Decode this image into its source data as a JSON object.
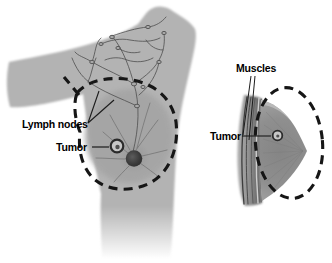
{
  "figure": {
    "panels": {
      "front": {
        "name": "front-view",
        "labels": {
          "lymph_nodes": "Lymph nodes",
          "tumor": "Tumor"
        }
      },
      "side": {
        "name": "side-view",
        "labels": {
          "muscles": "Muscles",
          "tumor": "Tumor"
        }
      }
    },
    "colors": {
      "background": "#ffffff",
      "body_silhouette": "#b3b3b3",
      "breast_tissue": "#a5a5a5",
      "side_breast": "#8d8d8d",
      "muscle_dark": "#3d3d3d",
      "outline_dash": "#161616",
      "lymph_vessel": "#4e4e4e",
      "nipple": "#383838",
      "label_text": "#000000",
      "leader_line": "#1b1b1b"
    }
  }
}
